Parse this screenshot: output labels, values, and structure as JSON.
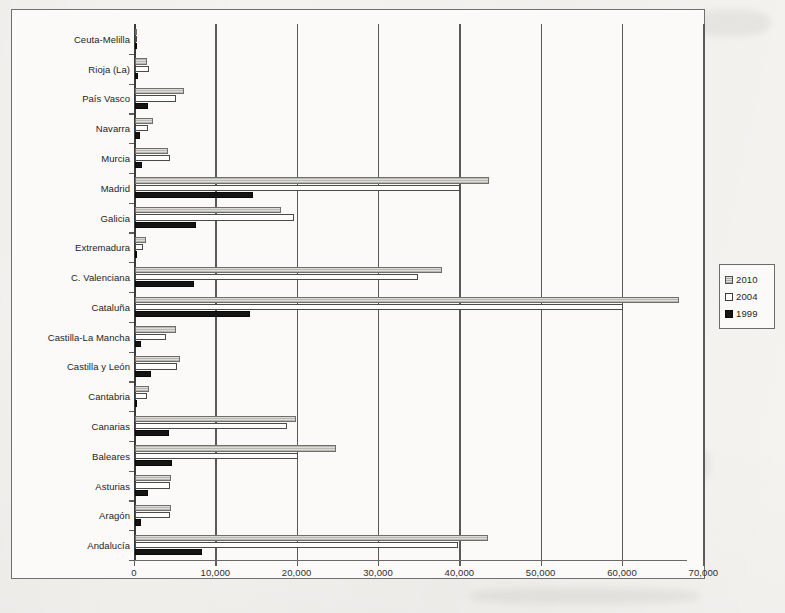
{
  "chart_data": {
    "type": "bar",
    "orientation": "horizontal",
    "title": "",
    "subtitle": "",
    "xlabel": "",
    "ylabel": "",
    "xlim": [
      0,
      70000
    ],
    "xticks": [
      0,
      10000,
      20000,
      30000,
      40000,
      50000,
      60000,
      70000
    ],
    "xtick_labels": [
      "0",
      "10,000",
      "20,000",
      "30,000",
      "40,000",
      "50,000",
      "60,000",
      "70,000"
    ],
    "grid": true,
    "grid_axis": "x",
    "legend_position": "right",
    "categories": [
      "Ceuta-Melilla",
      "Rioja (La)",
      "País Vasco",
      "Navarra",
      "Murcia",
      "Madrid",
      "Galicia",
      "Extremadura",
      "C. Valenciana",
      "Cataluña",
      "Castilla-La Mancha",
      "Castilla y León",
      "Cantabria",
      "Canarias",
      "Baleares",
      "Asturias",
      "Aragón",
      "Andalucía"
    ],
    "series": [
      {
        "name": "2010",
        "color": "#c9c7c2",
        "values": [
          200,
          1500,
          6000,
          2250,
          4000,
          43500,
          18000,
          1400,
          37800,
          66900,
          5000,
          5500,
          1750,
          19800,
          24700,
          4400,
          4400,
          43400
        ]
      },
      {
        "name": "2004",
        "color": "#fdfdfb",
        "values": [
          150,
          1700,
          5000,
          1600,
          4300,
          40000,
          19500,
          1000,
          34800,
          60000,
          3800,
          5200,
          1500,
          18700,
          20000,
          4300,
          4300,
          39700
        ]
      },
      {
        "name": "1999",
        "color": "#141414",
        "values": [
          60,
          400,
          1550,
          600,
          800,
          14500,
          7500,
          300,
          7200,
          14200,
          700,
          2000,
          300,
          4200,
          4600,
          1600,
          700,
          8200
        ]
      }
    ]
  },
  "legend": {
    "entries": [
      {
        "label": "2010",
        "swatch": "hatched-gray-swatch"
      },
      {
        "label": "2004",
        "swatch": "white-swatch"
      },
      {
        "label": "1999",
        "swatch": "black-swatch"
      }
    ]
  }
}
